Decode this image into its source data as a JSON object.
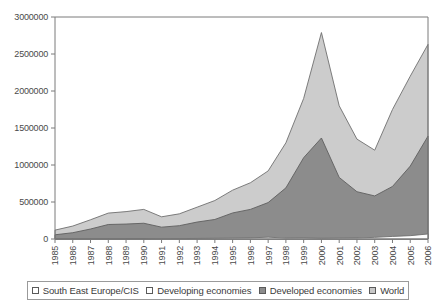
{
  "chart_data": {
    "type": "area",
    "title": "",
    "subtitle": "",
    "xlabel": "",
    "ylabel": "",
    "stacked": true,
    "grid": false,
    "legend_position": "bottom",
    "ylim": [
      0,
      3000000
    ],
    "y_ticks": [
      "0",
      "500000",
      "1000000",
      "1500000",
      "2000000",
      "2500000",
      "3000000"
    ],
    "y_tick_values": [
      0,
      500000,
      1000000,
      1500000,
      2000000,
      2500000,
      3000000
    ],
    "categories": [
      "1985",
      "1986",
      "1987",
      "1988",
      "1989",
      "1990",
      "1991",
      "1992",
      "1993",
      "1994",
      "1995",
      "1996",
      "1997",
      "1998",
      "1999",
      "2000",
      "2001",
      "2002",
      "2003",
      "2004",
      "2005",
      "2006"
    ],
    "x": [
      1985,
      1986,
      1987,
      1988,
      1989,
      1990,
      1991,
      1992,
      1993,
      1994,
      1995,
      1996,
      1997,
      1998,
      1999,
      2000,
      2001,
      2002,
      2003,
      2004,
      2005,
      2006
    ],
    "series": [
      {
        "name": "South East Europe/CIS",
        "color": "#ffffff",
        "values": [
          0,
          0,
          0,
          0,
          0,
          1000,
          3000,
          5000,
          8000,
          10000,
          12000,
          15000,
          25000,
          12000,
          14000,
          10000,
          12000,
          14000,
          22000,
          35000,
          45000,
          68000
        ]
      },
      {
        "name": "Developing economies",
        "color": "#c8c8c8",
        "values": [
          14000,
          18000,
          26000,
          32000,
          30000,
          36000,
          42000,
          55000,
          82000,
          108000,
          118000,
          155000,
          195000,
          195000,
          235000,
          265000,
          220000,
          175000,
          180000,
          255000,
          320000,
          380000
        ]
      },
      {
        "name": "Developed economies",
        "color": "#8c8c8c",
        "values": [
          43000,
          67000,
          109000,
          164000,
          172000,
          176000,
          115000,
          120000,
          139000,
          146000,
          222000,
          230000,
          272000,
          484000,
          850000,
          1090000,
          600000,
          450000,
          380000,
          420000,
          620000,
          942000
        ]
      },
      {
        "name": "World",
        "color": "#cccccc",
        "values": [
          57000,
          85000,
          135000,
          196000,
          202000,
          213000,
          160000,
          180000,
          229000,
          264000,
          352000,
          400000,
          492000,
          691000,
          1099000,
          1365000,
          832000,
          639000,
          582000,
          710000,
          985000,
          1390000
        ]
      }
    ],
    "stack_tops": {
      "band1_cis": [
        0,
        0,
        0,
        0,
        0,
        1000,
        3000,
        5000,
        8000,
        10000,
        12000,
        15000,
        25000,
        12000,
        14000,
        10000,
        12000,
        14000,
        22000,
        35000,
        45000,
        68000
      ],
      "band2_developed": [
        57000,
        85000,
        135000,
        196000,
        202000,
        213000,
        160000,
        180000,
        229000,
        264000,
        352000,
        400000,
        492000,
        691000,
        1099000,
        1365000,
        832000,
        639000,
        582000,
        710000,
        985000,
        1390000
      ],
      "band3_world_total": [
        120000,
        175000,
        260000,
        350000,
        370000,
        400000,
        300000,
        340000,
        430000,
        520000,
        660000,
        760000,
        920000,
        1300000,
        1900000,
        2790000,
        1800000,
        1350000,
        1200000,
        1750000,
        2200000,
        2630000
      ]
    },
    "annotations": []
  },
  "legend": {
    "items": [
      {
        "label": "South East Europe/CIS",
        "color": "#ffffff",
        "swatch_name": "legend-swatch-cis"
      },
      {
        "label": "Developing economies",
        "color": "#ffffff",
        "swatch_name": "legend-swatch-developing"
      },
      {
        "label": "Developed economies",
        "color": "#8c8c8c",
        "swatch_name": "legend-swatch-developed"
      },
      {
        "label": "World",
        "color": "#c8c8c8",
        "swatch_name": "legend-swatch-world"
      }
    ]
  }
}
